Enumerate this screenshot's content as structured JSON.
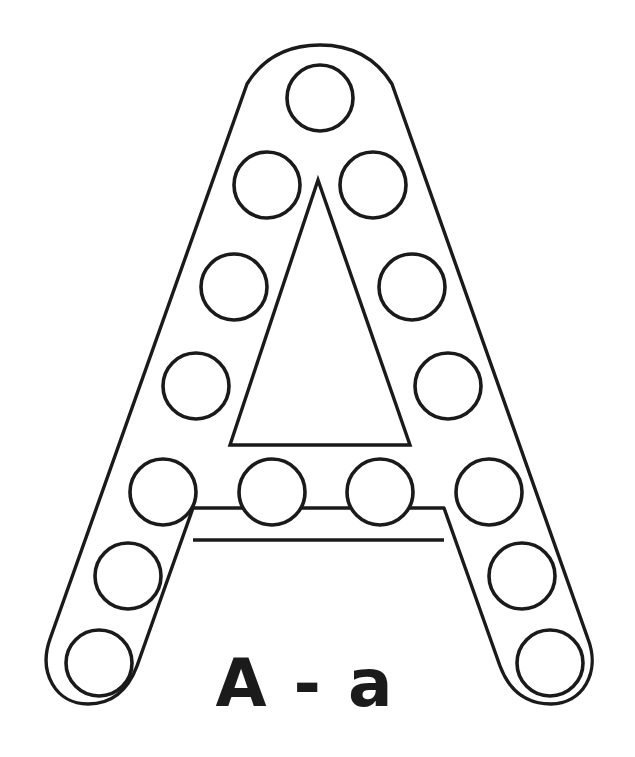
{
  "page": {
    "background_color": "#ffffff",
    "ink_color": "#1a1a1a",
    "width": 635,
    "height": 757
  },
  "caption": {
    "text": "A - a",
    "uppercase": "A",
    "separator": "-",
    "lowercase": "a",
    "x": 305,
    "y": 706,
    "font_size": 66,
    "color": "#1b1b1b"
  },
  "letter": {
    "glyph": "A",
    "style": "outline-bold-rounded",
    "stroke_color": "#1a1a1a",
    "stroke_width": 3.4,
    "fill": "#ffffff",
    "outer_path": "M 320 45 C 352 45 376 58 392 84 L 588 639 C 601 673 582 704 551 704 C 525 704 509 690 500 666 L 444 508 L 193 508 L 137 666 C 128 690 112 704 88 704 C 56 704 38 673 50 639 L 247 84 C 263 58 288 45 320 45 Z",
    "counter_path": "M 318 180 L 410 445 L 230 445 Z",
    "crossbar_path": "M 193 540 L 444 540"
  },
  "dots": {
    "count": 15,
    "radius": 33,
    "fill": "#ffffff",
    "stroke": "#1a1a1a",
    "rows": [
      {
        "row": 1,
        "label": "apex-row",
        "circles": [
          {
            "cx": 320,
            "cy": 98
          }
        ]
      },
      {
        "row": 2,
        "label": "upper-row",
        "circles": [
          {
            "cx": 267,
            "cy": 185
          },
          {
            "cx": 373,
            "cy": 185
          }
        ]
      },
      {
        "row": 3,
        "label": "upper-mid-row",
        "circles": [
          {
            "cx": 234,
            "cy": 287
          },
          {
            "cx": 412,
            "cy": 287
          }
        ]
      },
      {
        "row": 4,
        "label": "lower-mid-row",
        "circles": [
          {
            "cx": 196,
            "cy": 386
          },
          {
            "cx": 448,
            "cy": 386
          }
        ]
      },
      {
        "row": 5,
        "label": "crossbar-row",
        "circles": [
          {
            "cx": 163,
            "cy": 492
          },
          {
            "cx": 272,
            "cy": 492
          },
          {
            "cx": 380,
            "cy": 492
          },
          {
            "cx": 489,
            "cy": 492
          }
        ]
      },
      {
        "row": 6,
        "label": "leg-row",
        "circles": [
          {
            "cx": 128,
            "cy": 576
          },
          {
            "cx": 522,
            "cy": 576
          }
        ]
      },
      {
        "row": 7,
        "label": "foot-row",
        "circles": [
          {
            "cx": 99,
            "cy": 663
          },
          {
            "cx": 550,
            "cy": 663
          }
        ]
      }
    ]
  }
}
